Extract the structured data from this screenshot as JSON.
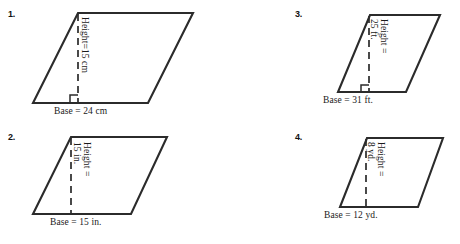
{
  "page": {
    "background_color": "#ffffff",
    "stroke_color": "#2b2b2b",
    "text_color": "#1a1a1a"
  },
  "problems": [
    {
      "number": "1.",
      "shape": "parallelogram",
      "height_label_lines": [
        "Height=15 cm"
      ],
      "height_label_text": "Height=15 cm",
      "height_value": "15",
      "height_unit": "cm",
      "base_label": "Base = 24 cm",
      "base_value": "24",
      "base_unit": "cm",
      "has_right_angle_marker": true,
      "dashed_height_line": true
    },
    {
      "number": "2.",
      "shape": "parallelogram",
      "height_label_lines": [
        "Height =",
        "15 in."
      ],
      "height_label_text": "Height = 15 in.",
      "height_value": "15",
      "height_unit": "in.",
      "base_label": "Base = 15 in.",
      "base_value": "15",
      "base_unit": "in.",
      "has_right_angle_marker": false,
      "dashed_height_line": true
    },
    {
      "number": "3.",
      "shape": "parallelogram",
      "height_label_lines": [
        "Height =",
        "25 ft."
      ],
      "height_label_text": "Height = 25 ft.",
      "height_value": "25",
      "height_unit": "ft.",
      "base_label": "Base = 31 ft.",
      "base_value": "31",
      "base_unit": "ft.",
      "has_right_angle_marker": true,
      "dashed_height_line": true
    },
    {
      "number": "4.",
      "shape": "parallelogram",
      "height_label_lines": [
        "Height =",
        "8 yd."
      ],
      "height_label_text": "Height = 8 yd.",
      "height_value": "8",
      "height_unit": "yd.",
      "base_label": "Base = 12 yd.",
      "base_value": "12",
      "base_unit": "yd.",
      "has_right_angle_marker": false,
      "dashed_height_line": true
    }
  ]
}
